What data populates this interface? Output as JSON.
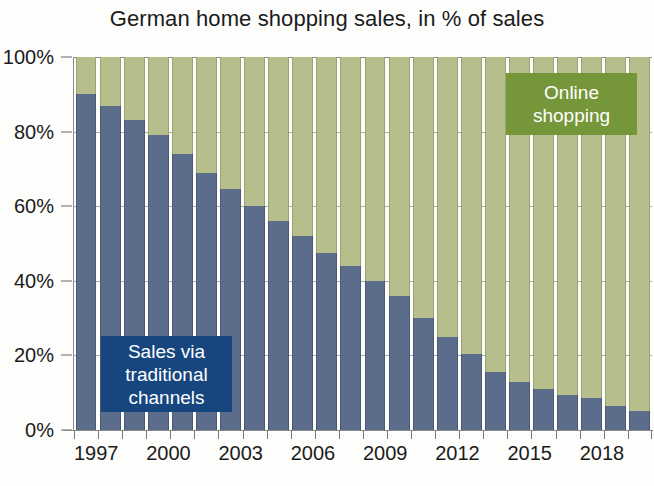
{
  "chart_data": {
    "type": "bar",
    "stacked": true,
    "title": "German home shopping sales, in % of sales",
    "xlabel": "",
    "ylabel": "",
    "ylim": [
      0,
      100
    ],
    "ytick_labels": [
      "100%",
      "80%",
      "60%",
      "40%",
      "20%",
      "0%"
    ],
    "ytick_values": [
      100,
      80,
      60,
      40,
      20,
      0
    ],
    "grid": true,
    "legend_position": "inside-plot",
    "categories": [
      "1997",
      "1998",
      "1999",
      "2000",
      "2001",
      "2002",
      "2003",
      "2004",
      "2005",
      "2006",
      "2007",
      "2008",
      "2009",
      "2010",
      "2011",
      "2012",
      "2013",
      "2014",
      "2015",
      "2016",
      "2017",
      "2018",
      "2019",
      "2020"
    ],
    "xtick_labels_shown": [
      "1997",
      "2000",
      "2003",
      "2006",
      "2009",
      "2012",
      "2015",
      "2018"
    ],
    "series": [
      {
        "name": "Sales via traditional channels",
        "color": "#5c6d8b",
        "values": [
          90,
          87,
          83,
          79,
          74,
          69,
          64.5,
          60,
          56,
          52,
          47.5,
          44,
          40,
          36,
          30,
          25,
          20.5,
          15.5,
          13,
          11,
          9.5,
          8.5,
          6.5,
          5
        ]
      },
      {
        "name": "Online shopping",
        "color": "#b6bf8b",
        "values": [
          10,
          13,
          17,
          21,
          26,
          31,
          35.5,
          40,
          44,
          48,
          52.5,
          56,
          60,
          64,
          70,
          75,
          79.5,
          84.5,
          87,
          89,
          90.5,
          91.5,
          93.5,
          95
        ]
      }
    ],
    "annotations": [
      {
        "id": "legend-traditional",
        "text_lines": [
          "Sales via",
          "traditional",
          "channels"
        ],
        "box_color": "#17467f",
        "text_color": "#ffffff"
      },
      {
        "id": "legend-online",
        "text_lines": [
          "Online",
          "shopping"
        ],
        "box_color": "#76963a",
        "text_color": "#ffffff"
      }
    ]
  },
  "legend": {
    "traditional": {
      "line1": "Sales via",
      "line2": "traditional",
      "line3": "channels"
    },
    "online": {
      "line1": "Online",
      "line2": "shopping"
    }
  }
}
